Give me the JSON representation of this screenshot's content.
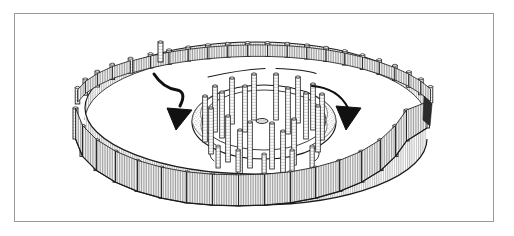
{
  "figure": {
    "title": "Reconstruction drawing of a henge monument with outer timber palisade and inner post circle",
    "medium": "pen-and-ink line drawing",
    "background_color": "#ffffff",
    "ink_color": "#1a1a1a",
    "frame": {
      "visible": true,
      "border_color": "#9a9a9a",
      "border_width_px": 1,
      "x": 14,
      "y": 13,
      "width": 480,
      "height": 209
    },
    "view": "oblique aerial perspective",
    "elements": [
      {
        "name": "outer-palisade-fence",
        "description": "Elliptical enclosure of close-set vertical timber posts with hatched plank panels between them",
        "shape": "ellipse",
        "center_x": 256,
        "center_y": 112,
        "radius_x": 178,
        "radius_y": 72,
        "wall_height_px": 30,
        "post_count": 34,
        "entrance_gap": "upper-left"
      },
      {
        "name": "inner-ditch-ring",
        "description": "Inner elliptical ditch and bank with stippled shading on the left and right flanks",
        "shape": "ellipse",
        "center_x": 264,
        "center_y": 122,
        "radius_x": 72,
        "radius_y": 37,
        "shading": "stipple"
      },
      {
        "name": "inner-post-circle",
        "description": "Ring of tall free-standing timber posts inside the ditch",
        "post_count": 18,
        "post_height_px": 48
      },
      {
        "name": "central-feature",
        "description": "Small oval mark at the centre of the monument",
        "center_x": 262,
        "center_y": 121,
        "width": 12,
        "height": 5
      },
      {
        "name": "left-entrance-arrow",
        "description": "Curved arrow sweeping from the upper-left fence gap down into the interior",
        "direction": "down-right",
        "head_x": 176,
        "head_y": 125
      },
      {
        "name": "right-entrance-arrow",
        "description": "Curved arrow sweeping from the interior toward the lower-right",
        "direction": "down-right",
        "head_x": 348,
        "head_y": 126
      },
      {
        "name": "ground-line-upper",
        "description": "Two short free-standing ground contour strokes above the inner ring"
      }
    ]
  }
}
